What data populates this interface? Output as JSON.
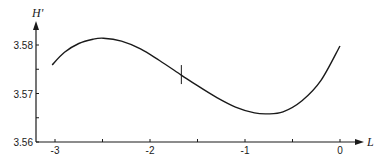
{
  "chart_data": {
    "type": "line",
    "title": "",
    "xlabel": "L",
    "ylabel": "H'",
    "xlim": [
      -3.2,
      0.25
    ],
    "ylim": [
      3.56,
      3.585
    ],
    "grid": false,
    "legend": null,
    "x_ticks": [
      {
        "value": -3,
        "label": "-3"
      },
      {
        "value": -2.5,
        "label": ""
      },
      {
        "value": -2,
        "label": "-2"
      },
      {
        "value": -1.5,
        "label": ""
      },
      {
        "value": -1,
        "label": "-1"
      },
      {
        "value": -0.5,
        "label": ""
      },
      {
        "value": 0,
        "label": "0"
      }
    ],
    "y_ticks": [
      {
        "value": 3.56,
        "label": "3.56"
      },
      {
        "value": 3.565,
        "label": ""
      },
      {
        "value": 3.57,
        "label": "3.57"
      },
      {
        "value": 3.575,
        "label": ""
      },
      {
        "value": 3.58,
        "label": "3.58"
      }
    ],
    "series": [
      {
        "name": "H'",
        "color": "#1a1a1a",
        "x": [
          -3.03,
          -2.9,
          -2.75,
          -2.6,
          -2.49,
          -2.3,
          -2.1,
          -1.9,
          -1.67,
          -1.5,
          -1.3,
          -1.1,
          -0.9,
          -0.77,
          -0.6,
          -0.4,
          -0.2,
          0.0
        ],
        "y": [
          3.5759,
          3.5785,
          3.5803,
          3.5812,
          3.5814,
          3.5808,
          3.5792,
          3.5768,
          3.5738,
          3.5716,
          3.5692,
          3.5672,
          3.566,
          3.5658,
          3.5662,
          3.5685,
          3.5727,
          3.5798
        ]
      }
    ],
    "annotations": [
      {
        "type": "vertical-marker",
        "x": -1.67,
        "y": 3.5738,
        "note": "short vertical tick crossing the curve"
      }
    ]
  }
}
